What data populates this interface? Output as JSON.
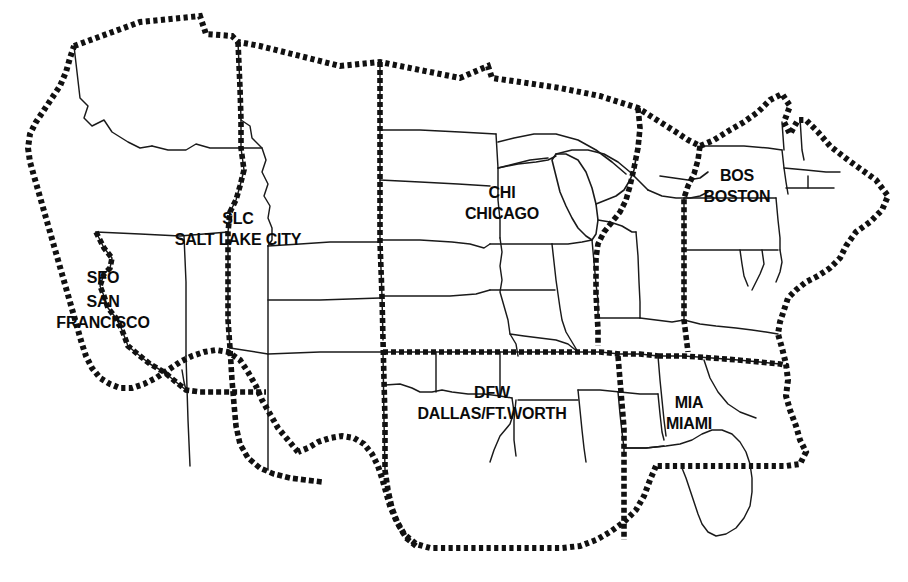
{
  "map": {
    "title": "United States Airline Hub Regions Map",
    "style": "black-and-white outline map",
    "background_color": "#ffffff",
    "line_color": "#111111",
    "state_border_style": "thin solid",
    "region_border_style": "heavy dotted",
    "region_count": 6
  },
  "hubs": [
    {
      "code": "SFO",
      "city": "SAN FRANCISCO",
      "city_line1": "SAN",
      "city_line2": "FRANCISCO",
      "region": "West / Pacific",
      "label_x": 103,
      "label_y": 270
    },
    {
      "code": "SLC",
      "city": "SALT LAKE CITY",
      "region": "Mountain / Intermountain West",
      "label_x": 238,
      "label_y": 211
    },
    {
      "code": "CHI",
      "city": "CHICAGO",
      "region": "Midwest",
      "label_x": 502,
      "label_y": 185
    },
    {
      "code": "BOS",
      "city": "BOSTON",
      "region": "Northeast",
      "label_x": 737,
      "label_y": 168
    },
    {
      "code": "DFW",
      "city": "DALLAS/FT.WORTH",
      "region": "South Central",
      "label_x": 492,
      "label_y": 385
    },
    {
      "code": "MIA",
      "city": "MIAMI",
      "region": "Southeast",
      "label_x": 689,
      "label_y": 395
    }
  ]
}
